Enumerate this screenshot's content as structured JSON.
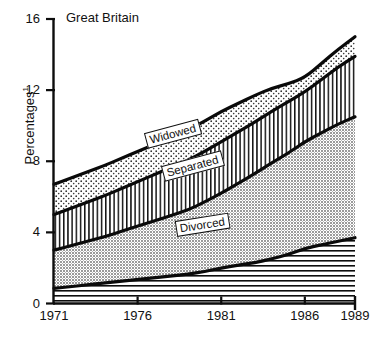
{
  "chart_data": {
    "type": "area",
    "title": "Great Britain",
    "subtitle": "",
    "xlabel": "",
    "ylabel": "Percentages",
    "ylabel_superscript": "1",
    "xlim": [
      1971,
      1989
    ],
    "ylim": [
      0,
      16
    ],
    "yticks": [
      "0",
      "4",
      "8",
      "12",
      "16"
    ],
    "ytick_values": [
      0,
      4,
      8,
      12,
      16
    ],
    "xticks": [
      "1971",
      "1976",
      "1981",
      "1986",
      "1989"
    ],
    "xtick_values": [
      1971,
      1976,
      1981,
      1986,
      1989
    ],
    "grid": false,
    "legend_position": "inline-labels",
    "stacked": true,
    "x": [
      1971,
      1972,
      1973,
      1974,
      1975,
      1976,
      1977,
      1978,
      1979,
      1980,
      1981,
      1982,
      1983,
      1984,
      1985,
      1986,
      1987,
      1988,
      1989
    ],
    "series": [
      {
        "name": "Single",
        "label_shown": false,
        "fill": "horizontal-lines",
        "values": [
          0.85,
          0.95,
          1.05,
          1.15,
          1.25,
          1.35,
          1.45,
          1.55,
          1.65,
          1.8,
          2.0,
          2.15,
          2.3,
          2.5,
          2.75,
          3.1,
          3.3,
          3.5,
          3.7
        ]
      },
      {
        "name": "Divorced",
        "label_shown": true,
        "fill": "grey-stipple",
        "values": [
          2.15,
          2.3,
          2.45,
          2.6,
          2.8,
          3.0,
          3.2,
          3.4,
          3.6,
          3.9,
          4.2,
          4.6,
          5.0,
          5.4,
          5.7,
          6.0,
          6.3,
          6.6,
          6.8
        ]
      },
      {
        "name": "Separated",
        "label_shown": true,
        "fill": "vertical-lines",
        "values": [
          2.0,
          2.1,
          2.2,
          2.3,
          2.4,
          2.5,
          2.6,
          2.7,
          2.8,
          2.85,
          2.9,
          2.9,
          2.9,
          2.9,
          2.9,
          2.8,
          3.0,
          3.2,
          3.4
        ]
      },
      {
        "name": "Widowed",
        "label_shown": true,
        "fill": "dotted-stipple",
        "values": [
          1.7,
          1.7,
          1.7,
          1.7,
          1.7,
          1.7,
          1.7,
          1.7,
          1.7,
          1.7,
          1.7,
          1.6,
          1.5,
          1.3,
          1.0,
          0.8,
          0.9,
          1.0,
          1.1
        ]
      }
    ],
    "cumulative_tops": {
      "single": [
        0.85,
        0.95,
        1.05,
        1.15,
        1.25,
        1.35,
        1.45,
        1.55,
        1.65,
        1.8,
        2.0,
        2.15,
        2.3,
        2.5,
        2.75,
        3.1,
        3.3,
        3.5,
        3.7
      ],
      "divorced": [
        3.0,
        3.25,
        3.5,
        3.75,
        4.05,
        4.35,
        4.65,
        4.95,
        5.25,
        5.7,
        6.2,
        6.75,
        7.3,
        7.9,
        8.45,
        9.1,
        9.6,
        10.1,
        10.5
      ],
      "separated": [
        5.0,
        5.35,
        5.7,
        6.05,
        6.45,
        6.85,
        7.25,
        7.65,
        8.05,
        8.55,
        9.1,
        9.65,
        10.2,
        10.8,
        11.35,
        11.9,
        12.6,
        13.3,
        13.9
      ],
      "widowed": [
        6.7,
        7.05,
        7.4,
        7.75,
        8.15,
        8.55,
        8.95,
        9.35,
        9.75,
        10.25,
        10.8,
        11.25,
        11.7,
        12.1,
        12.35,
        12.7,
        13.5,
        14.3,
        15.0
      ]
    },
    "annotations": [
      {
        "name": "Widowed",
        "text": "Widowed",
        "at_x": 1977,
        "at_y": 9.2
      },
      {
        "name": "Separated",
        "text": "Separated",
        "at_x": 1978,
        "at_y": 7.6
      },
      {
        "name": "Divorced",
        "text": "Divorced",
        "at_x": 1979,
        "at_y": 4.9
      }
    ]
  },
  "footnote": " "
}
